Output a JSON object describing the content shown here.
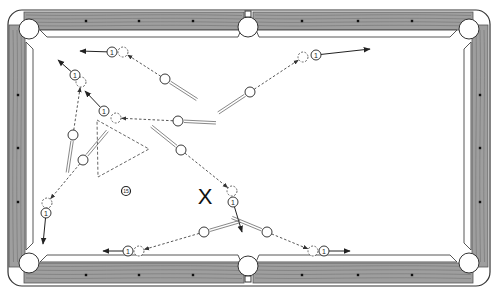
{
  "diagram": {
    "colors": {
      "rail": "#9a9a9a",
      "rail_grain": "#6e6e6e",
      "outline": "#333333",
      "felt": "#ffffff",
      "diamond": "#111111",
      "path": "#444444"
    },
    "object_ball_label": "1",
    "extra_ball_label": "15",
    "marker_label": "X",
    "legend": {
      "cue_ball": "cue ball (white)",
      "ghost_ball": "ghost ball (dashed) at contact point",
      "object_ball": "object ball 1",
      "cue_path": "dashed line = cue ball path",
      "object_path": "solid arrow = object ball path"
    },
    "shots": [
      {
        "id": "shot-top-left-1",
        "cue": [
          165,
          79
        ],
        "ghost": [
          123,
          52
        ],
        "object": [
          112,
          52
        ],
        "target": [
          80,
          51
        ],
        "stick": "right-down"
      },
      {
        "id": "shot-left-upper",
        "cue": [
          73,
          135
        ],
        "ghost": [
          81,
          82
        ],
        "object": [
          75,
          75
        ],
        "target": [
          58,
          60
        ],
        "stick": "down"
      },
      {
        "id": "shot-center-left",
        "cue": [
          178,
          121
        ],
        "ghost": [
          116,
          118
        ],
        "object": [
          104,
          111
        ],
        "target": [
          85,
          91
        ],
        "stick": "right"
      },
      {
        "id": "shot-top-right",
        "cue": [
          250,
          92
        ],
        "ghost": [
          303,
          57
        ],
        "object": [
          316,
          55
        ],
        "target": [
          370,
          49
        ],
        "stick": "left-down"
      },
      {
        "id": "shot-center-down",
        "cue": [
          181,
          150
        ],
        "ghost": [
          232,
          191
        ],
        "object": [
          233,
          202
        ],
        "target": [
          242,
          232
        ],
        "stick": "left-up"
      },
      {
        "id": "shot-left-lower",
        "cue": [
          83,
          160
        ],
        "ghost": [
          47,
          203
        ],
        "object": [
          46,
          213
        ],
        "target": [
          43,
          244
        ],
        "stick": "right-up"
      },
      {
        "id": "shot-bottom-left",
        "cue": [
          204,
          232
        ],
        "ghost": [
          139,
          251
        ],
        "object": [
          128,
          251
        ],
        "target": [
          103,
          251
        ],
        "stick": "right-up"
      },
      {
        "id": "shot-bottom-right",
        "cue": [
          267,
          232
        ],
        "ghost": [
          313,
          251
        ],
        "object": [
          324,
          251
        ],
        "target": [
          350,
          251
        ],
        "stick": "left-up"
      }
    ],
    "triangle": [
      [
        97,
        120
      ],
      [
        149,
        149
      ],
      [
        98,
        177
      ]
    ],
    "ball_15": [
      126,
      191
    ],
    "x_marker": [
      205,
      196
    ]
  }
}
